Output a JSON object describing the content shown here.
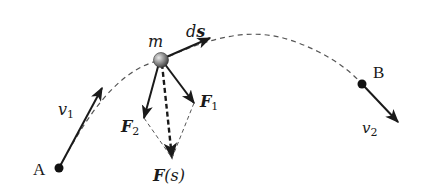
{
  "diagram": {
    "points": {
      "A": {
        "label": "A"
      },
      "B": {
        "label": "B"
      }
    },
    "mass": {
      "label": "m"
    },
    "vectors": {
      "v1": {
        "symbol": "v",
        "subscript": "1"
      },
      "v2": {
        "symbol": "v",
        "subscript": "2"
      },
      "ds": {
        "symbol": "d",
        "bold": "s"
      },
      "F1": {
        "symbol": "F",
        "subscript": "1"
      },
      "F2": {
        "symbol": "F",
        "subscript": "2"
      },
      "Fs": {
        "symbol": "F",
        "argument": "(s)"
      }
    },
    "colors": {
      "line": "#1a1a1a",
      "dashed": "#555555",
      "ball": "#888888",
      "background": "#ffffff"
    }
  }
}
